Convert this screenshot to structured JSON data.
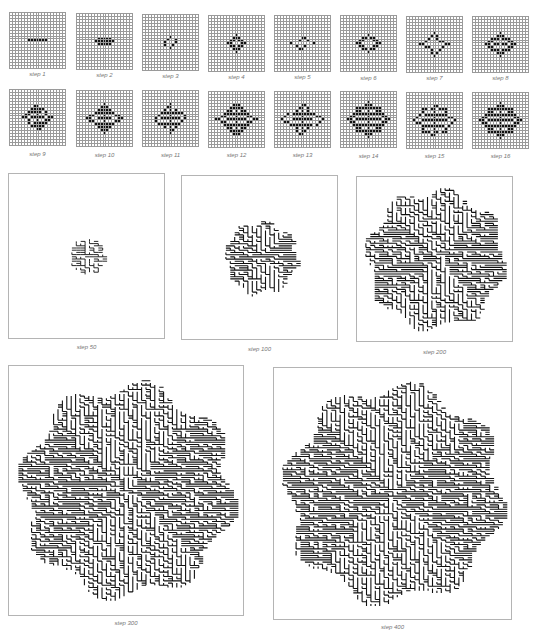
{
  "figure": {
    "background": "#ffffff",
    "cell_on_color": "#111111",
    "gridline_color": "#9a9a9a",
    "frame_color": "#b4b4b4",
    "caption_color": "#777777"
  },
  "small_panels": [
    {
      "label": "step 1",
      "x": 9,
      "y": 12,
      "size": 57,
      "cap_y": 71
    },
    {
      "label": "step 2",
      "x": 76,
      "y": 13,
      "size": 57,
      "cap_y": 72
    },
    {
      "label": "step 3",
      "x": 142,
      "y": 14,
      "size": 57,
      "cap_y": 73
    },
    {
      "label": "step 4",
      "x": 208,
      "y": 15,
      "size": 57,
      "cap_y": 74
    },
    {
      "label": "step 5",
      "x": 274,
      "y": 15,
      "size": 57,
      "cap_y": 74
    },
    {
      "label": "step 6",
      "x": 340,
      "y": 15,
      "size": 57,
      "cap_y": 75
    },
    {
      "label": "step 7",
      "x": 406,
      "y": 16,
      "size": 57,
      "cap_y": 75
    },
    {
      "label": "step 8",
      "x": 472,
      "y": 16,
      "size": 57,
      "cap_y": 75
    },
    {
      "label": "step 9",
      "x": 9,
      "y": 89,
      "size": 57,
      "cap_y": 151
    },
    {
      "label": "step 10",
      "x": 76,
      "y": 90,
      "size": 57,
      "cap_y": 152
    },
    {
      "label": "step 11",
      "x": 142,
      "y": 90,
      "size": 57,
      "cap_y": 152
    },
    {
      "label": "step 12",
      "x": 208,
      "y": 91,
      "size": 57,
      "cap_y": 152
    },
    {
      "label": "step 13",
      "x": 274,
      "y": 91,
      "size": 57,
      "cap_y": 152
    },
    {
      "label": "step 14",
      "x": 340,
      "y": 91,
      "size": 57,
      "cap_y": 153
    },
    {
      "label": "step 15",
      "x": 406,
      "y": 92,
      "size": 57,
      "cap_y": 153
    },
    {
      "label": "step 16",
      "x": 472,
      "y": 92,
      "size": 57,
      "cap_y": 153
    }
  ],
  "medium_panels": [
    {
      "label": "step 50",
      "x": 8,
      "y": 173,
      "w": 157,
      "h": 166,
      "cap_y": 344,
      "radius": 19
    },
    {
      "label": "step 100",
      "x": 181,
      "y": 175,
      "w": 157,
      "h": 165,
      "cap_y": 346,
      "radius": 38
    },
    {
      "label": "step 200",
      "x": 356,
      "y": 176,
      "w": 157,
      "h": 166,
      "cap_y": 349,
      "radius": 73
    }
  ],
  "large_panels": [
    {
      "label": "step 300",
      "x": 8,
      "y": 365,
      "w": 236,
      "h": 251,
      "cap_y": 620,
      "radius": 112
    },
    {
      "label": "step 400",
      "x": 273,
      "y": 367,
      "w": 239,
      "h": 253,
      "cap_y": 624,
      "radius": 114
    }
  ]
}
